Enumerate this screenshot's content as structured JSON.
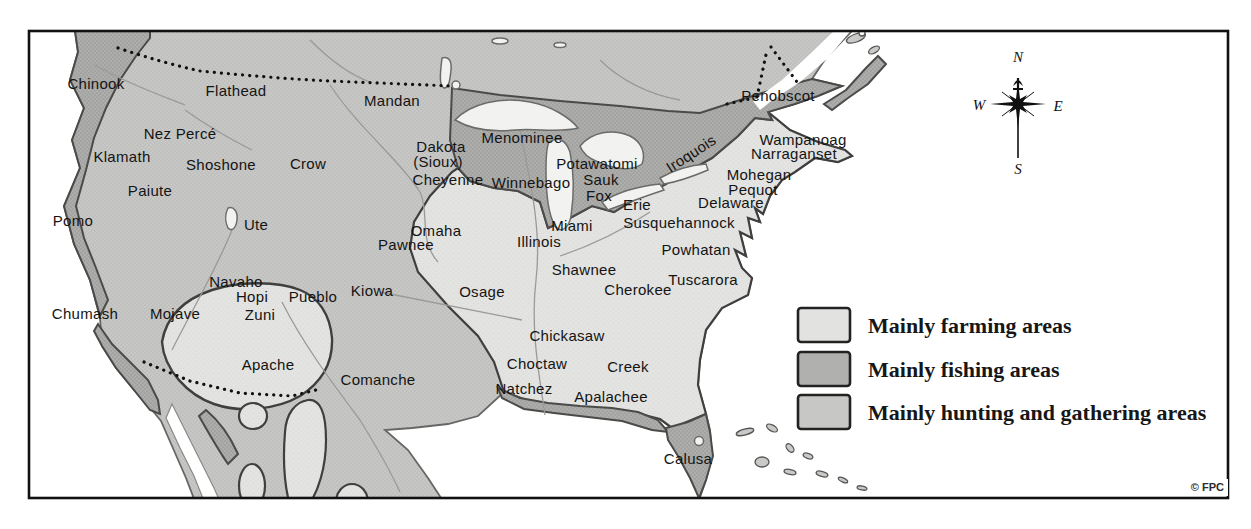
{
  "map": {
    "description": "Native American tribal areas map of North America",
    "labels": [
      {
        "text": "Chinook",
        "x": 96,
        "y": 89
      },
      {
        "text": "Flathead",
        "x": 236,
        "y": 96
      },
      {
        "text": "Mandan",
        "x": 392,
        "y": 106
      },
      {
        "text": "Nez Percé",
        "x": 180,
        "y": 139
      },
      {
        "text": "Klamath",
        "x": 122,
        "y": 162
      },
      {
        "text": "Shoshone",
        "x": 221,
        "y": 170
      },
      {
        "text": "Crow",
        "x": 308,
        "y": 169
      },
      {
        "text": "Paiute",
        "x": 150,
        "y": 196
      },
      {
        "text": "Pomo",
        "x": 73,
        "y": 226
      },
      {
        "text": "Ute",
        "x": 256,
        "y": 230
      },
      {
        "text": "Dakota",
        "x": 441,
        "y": 152
      },
      {
        "text": "(Sioux)",
        "x": 438,
        "y": 167
      },
      {
        "text": "Cheyenne",
        "x": 448,
        "y": 185
      },
      {
        "text": "Menominee",
        "x": 522,
        "y": 143
      },
      {
        "text": "Winnebago",
        "x": 531,
        "y": 188
      },
      {
        "text": "Potawatomi",
        "x": 597,
        "y": 169
      },
      {
        "text": "Sauk",
        "x": 601,
        "y": 185
      },
      {
        "text": "Fox",
        "x": 599,
        "y": 201
      },
      {
        "text": "Erie",
        "x": 637,
        "y": 210
      },
      {
        "text": "Iroquois",
        "x": 694,
        "y": 158,
        "rotate": -33
      },
      {
        "text": "Penobscot",
        "x": 778,
        "y": 101
      },
      {
        "text": "Wampanoag",
        "x": 803,
        "y": 145
      },
      {
        "text": "Narraganset",
        "x": 794,
        "y": 159
      },
      {
        "text": "Mohegan",
        "x": 759,
        "y": 180
      },
      {
        "text": "Pequot",
        "x": 753,
        "y": 195
      },
      {
        "text": "Delaware",
        "x": 731,
        "y": 208
      },
      {
        "text": "Susquehannock",
        "x": 679,
        "y": 228
      },
      {
        "text": "Powhatan",
        "x": 696,
        "y": 255
      },
      {
        "text": "Omaha",
        "x": 436,
        "y": 236
      },
      {
        "text": "Pawnee",
        "x": 406,
        "y": 250
      },
      {
        "text": "Miami",
        "x": 572,
        "y": 231
      },
      {
        "text": "Illinois",
        "x": 539,
        "y": 247
      },
      {
        "text": "Shawnee",
        "x": 584,
        "y": 275
      },
      {
        "text": "Cherokee",
        "x": 638,
        "y": 295
      },
      {
        "text": "Tuscarora",
        "x": 703,
        "y": 285
      },
      {
        "text": "Osage",
        "x": 482,
        "y": 297
      },
      {
        "text": "Kiowa",
        "x": 372,
        "y": 296
      },
      {
        "text": "Navaho",
        "x": 236,
        "y": 287
      },
      {
        "text": "Hopi",
        "x": 252,
        "y": 302
      },
      {
        "text": "Pueblo",
        "x": 313,
        "y": 302
      },
      {
        "text": "Zuni",
        "x": 260,
        "y": 320
      },
      {
        "text": "Chumash",
        "x": 85,
        "y": 319
      },
      {
        "text": "Mojave",
        "x": 175,
        "y": 319
      },
      {
        "text": "Apache",
        "x": 268,
        "y": 370
      },
      {
        "text": "Comanche",
        "x": 378,
        "y": 385
      },
      {
        "text": "Chickasaw",
        "x": 567,
        "y": 341
      },
      {
        "text": "Choctaw",
        "x": 537,
        "y": 369
      },
      {
        "text": "Creek",
        "x": 628,
        "y": 372
      },
      {
        "text": "Natchez",
        "x": 524,
        "y": 394
      },
      {
        "text": "Apalachee",
        "x": 611,
        "y": 402
      },
      {
        "text": "Calusa",
        "x": 688,
        "y": 464
      }
    ]
  },
  "legend": {
    "items": [
      {
        "label": "Mainly farming areas",
        "color": "#e2e2e0"
      },
      {
        "label": "Mainly fishing areas",
        "color": "#b0b0ae"
      },
      {
        "label": "Mainly hunting and gathering areas",
        "color": "#c7c7c5"
      }
    ]
  },
  "compass": {
    "north": "N",
    "south": "S",
    "east": "E",
    "west": "W"
  },
  "copyright": "© FPC",
  "colors": {
    "farming": "#e2e2e0",
    "fishing": "#aeaeac",
    "hunting": "#c7c7c5",
    "ocean": "#ffffff",
    "boundary": "#3f3f3f"
  }
}
